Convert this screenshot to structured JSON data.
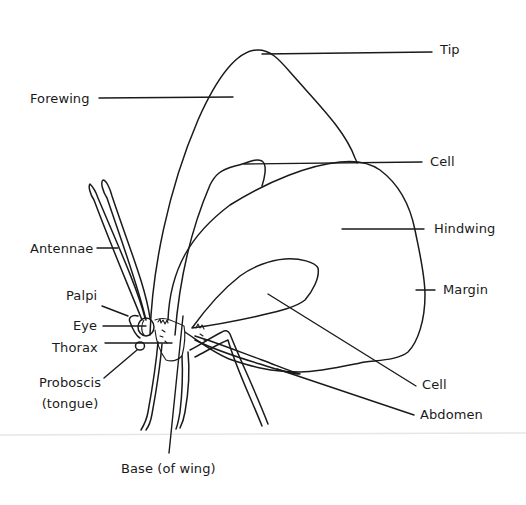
{
  "diagram": {
    "colors": {
      "ink": "#1a1a1a",
      "background": "#ffffff",
      "ground_line": "#e6e6e6"
    },
    "labels": {
      "tip": "Tip",
      "forewing": "Forewing",
      "cell_forewing": "Cell",
      "hindwing": "Hindwing",
      "antennae": "Antennae",
      "margin": "Margin",
      "palpi": "Palpi",
      "eye": "Eye",
      "thorax": "Thorax",
      "proboscis_line1": "Proboscis",
      "proboscis_line2": "(tongue)",
      "cell_hindwing": "Cell",
      "abdomen": "Abdomen",
      "base_of_wing": "Base (of wing)"
    }
  }
}
